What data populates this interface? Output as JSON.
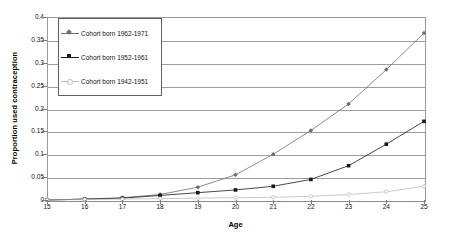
{
  "chart_data": {
    "type": "line",
    "title": "",
    "xlabel": "Age",
    "ylabel": "Proportion used contraception",
    "x": [
      15,
      16,
      17,
      18,
      19,
      20,
      21,
      22,
      23,
      24,
      25
    ],
    "xlim": [
      15,
      25
    ],
    "ylim": [
      0,
      0.4
    ],
    "xtick_labels": [
      "15",
      "16",
      "17",
      "18",
      "19",
      "20",
      "21",
      "22",
      "23",
      "24",
      "25"
    ],
    "ytick_labels": [
      "0",
      "0.05",
      "0.1",
      "0.15",
      "0.2",
      "0.25",
      "0.3",
      "0.35",
      "0.4"
    ],
    "ytick_values": [
      0,
      0.05,
      0.1,
      0.15,
      0.2,
      0.25,
      0.3,
      0.35,
      0.4
    ],
    "grid": "horizontal",
    "legend_position": "upper-left-inside",
    "series": [
      {
        "name": "Cohort born 1962-1971",
        "marker": "diamond",
        "color": "#6e6e6e",
        "values": [
          0,
          0.002,
          0.005,
          0.012,
          0.028,
          0.055,
          0.1,
          0.152,
          0.21,
          0.285,
          0.365
        ]
      },
      {
        "name": "Cohort born 1952-1961",
        "marker": "square",
        "color": "#1a1a1a",
        "values": [
          0,
          0.002,
          0.004,
          0.01,
          0.016,
          0.022,
          0.03,
          0.045,
          0.075,
          0.122,
          0.172
        ]
      },
      {
        "name": "Cohort born 1942-1951",
        "marker": "circle-open",
        "color": "#bdbdbd",
        "values": [
          0,
          0.001,
          0.002,
          0.003,
          0.004,
          0.005,
          0.006,
          0.008,
          0.012,
          0.018,
          0.03
        ]
      }
    ]
  },
  "legend": {
    "items": [
      {
        "label": "Cohort born 1962-1971"
      },
      {
        "label": "Cohort born 1952-1961"
      },
      {
        "label": "Cohort born 1942-1951"
      }
    ]
  },
  "axes": {
    "x_title": "Age",
    "y_title": "Proportion used contraception"
  }
}
